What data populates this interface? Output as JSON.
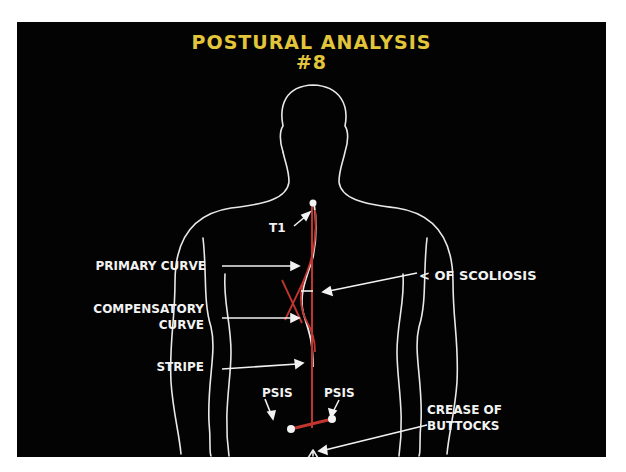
{
  "title": {
    "line1": "POSTURAL ANALYSIS",
    "line2": "#8"
  },
  "colors": {
    "background": "#030303",
    "title": "#e2c53a",
    "outline": "#e8e8e8",
    "spine_marker": "#c0362f",
    "text": "#f2f2f2"
  },
  "labels": {
    "t1": "T1",
    "primary_curve": "PRIMARY CURVE",
    "compensatory_curve_line1": "COMPENSATORY",
    "compensatory_curve_line2": "CURVE",
    "stripe": "STRIPE",
    "angle_of_scoliosis": "< OF SCOLIOSIS",
    "psis_left": "PSIS",
    "psis_right": "PSIS",
    "crease_line1": "CREASE OF",
    "crease_line2": "BUTTOCKS"
  }
}
